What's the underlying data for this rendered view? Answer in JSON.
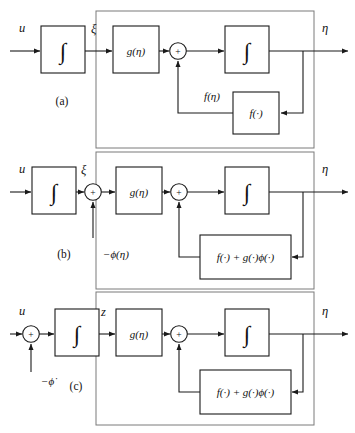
{
  "figure": {
    "background_color": "#ffffff",
    "line_color": "#1a1a1a",
    "outer_box_color": "#7a7a7a"
  },
  "symbols": {
    "integral": "∫",
    "plus": "+",
    "arrowhead": "arrow-right"
  },
  "panels": [
    {
      "id": "a",
      "id_label": "(a)",
      "input_label": "u",
      "output_label": "η",
      "mid_label": "ξ",
      "feedback_label": "f(η)",
      "blocks": [
        {
          "name": "integrator-input",
          "label": "∫"
        },
        {
          "name": "gain-g-eta",
          "label": "g(η)"
        },
        {
          "name": "integrator-forward",
          "label": "∫"
        },
        {
          "name": "feedback-f",
          "label": "f(·)"
        }
      ],
      "sum_signs": [
        "+"
      ]
    },
    {
      "id": "b",
      "id_label": "(b)",
      "input_label": "u",
      "output_label": "η",
      "mid_label": "ξ",
      "sum_input_label": "−ϕ(η)",
      "blocks": [
        {
          "name": "integrator-input",
          "label": "∫"
        },
        {
          "name": "gain-g-eta",
          "label": "g(η)"
        },
        {
          "name": "integrator-forward",
          "label": "∫"
        },
        {
          "name": "feedback-combined",
          "label": "f(·) + g(·)ϕ(·)"
        }
      ],
      "sum_signs": [
        "+",
        "+"
      ]
    },
    {
      "id": "c",
      "id_label": "(c)",
      "input_label": "u",
      "output_label": "η",
      "mid_label": "z",
      "sum_input_label": "−ϕ̇",
      "blocks": [
        {
          "name": "integrator-input",
          "label": "∫"
        },
        {
          "name": "gain-g-eta",
          "label": "g(η)"
        },
        {
          "name": "integrator-forward",
          "label": "∫"
        },
        {
          "name": "feedback-combined",
          "label": "f(·) + g(·)ϕ(·)"
        }
      ],
      "sum_signs": [
        "+",
        "+"
      ]
    }
  ]
}
